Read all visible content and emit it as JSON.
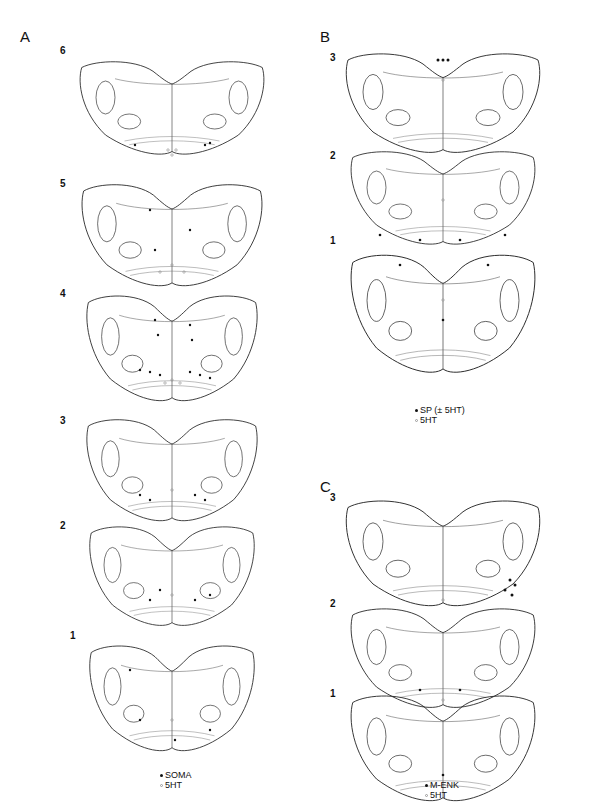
{
  "figure": {
    "panels": [
      {
        "id": "A",
        "label": "A",
        "sections": [
          "6",
          "5",
          "4",
          "3",
          "2",
          "1"
        ],
        "legend": [
          {
            "marker": "filled-dot",
            "text": "SOMA"
          },
          {
            "marker": "open-dot",
            "text": "5HT"
          }
        ]
      },
      {
        "id": "B",
        "label": "B",
        "sections": [
          "3",
          "2",
          "1"
        ],
        "legend": [
          {
            "marker": "filled-dot",
            "text": "SP (± 5HT)"
          },
          {
            "marker": "open-dot",
            "text": "5HT"
          }
        ]
      },
      {
        "id": "C",
        "label": "C",
        "sections": [
          "3",
          "2",
          "1"
        ],
        "legend": [
          {
            "marker": "filled-dot",
            "text": "M-ENK"
          },
          {
            "marker": "open-dot",
            "text": "5HT"
          }
        ]
      }
    ],
    "colors": {
      "line": "#222222",
      "filled_marker": "#111111",
      "open_marker": "#999999",
      "background": "#ffffff"
    }
  }
}
